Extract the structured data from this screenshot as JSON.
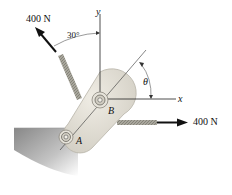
{
  "diagram": {
    "type": "statics-free-body",
    "forces": [
      {
        "label": "400 N",
        "direction": "up-left",
        "angle_from_y": "30°"
      },
      {
        "label": "400 N",
        "direction": "right"
      }
    ],
    "labels": {
      "force_top": "400 N",
      "force_right": "400 N",
      "angle_30": "30°",
      "theta": "θ",
      "axis_x": "x",
      "axis_y": "y",
      "point_A": "A",
      "point_B": "B"
    },
    "colors": {
      "member": "#dcd9cf",
      "member_edge": "#b8b4a8",
      "rope": "#9c9a90",
      "wall_shadow": "#8c8c8c",
      "arrow": "#111111",
      "axis": "#222222"
    }
  }
}
